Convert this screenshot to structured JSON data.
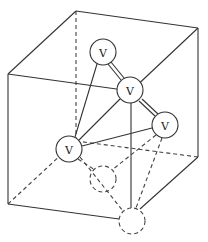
{
  "diagram": {
    "atom_label": "V",
    "colors": {
      "line": "#333333",
      "background": "#ffffff"
    },
    "cube_corners": {
      "back_top_left": [
        76,
        11
      ],
      "back_top_right": [
        198,
        28
      ],
      "front_top_left": [
        8,
        74
      ],
      "front_top_right": [
        131,
        91
      ],
      "back_bottom_left": [
        76,
        141
      ],
      "back_bottom_right": [
        198,
        157
      ],
      "front_bottom_left": [
        8,
        204
      ],
      "front_bottom_right": [
        132,
        221
      ]
    },
    "atoms": [
      {
        "id": "a1",
        "label": "V",
        "cx": 103,
        "cy": 52,
        "visible": true
      },
      {
        "id": "a2",
        "label": "V",
        "cx": 130,
        "cy": 90,
        "visible": true
      },
      {
        "id": "a3",
        "label": "V",
        "cx": 165,
        "cy": 125,
        "visible": true
      },
      {
        "id": "a4",
        "label": "V",
        "cx": 69,
        "cy": 149,
        "visible": true
      },
      {
        "id": "a5",
        "label": "",
        "cx": 103,
        "cy": 179,
        "visible": false
      },
      {
        "id": "a6",
        "label": "",
        "cx": 132,
        "cy": 221,
        "visible": false
      }
    ]
  }
}
